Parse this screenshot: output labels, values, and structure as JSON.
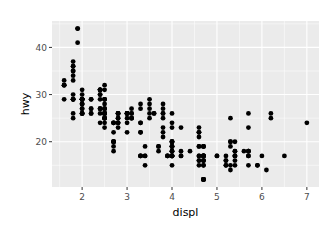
{
  "chart_data": {
    "type": "scatter",
    "title": "",
    "xlabel": "displ",
    "ylabel": "hwy",
    "xlim": [
      1.33,
      7.27
    ],
    "ylim": [
      10.4,
      45.6
    ],
    "xticks": [
      2,
      3,
      4,
      5,
      6,
      7
    ],
    "yticks": [
      20,
      30,
      40
    ],
    "grid": true,
    "legend": null,
    "colors": {
      "panel": "#EBEBEB",
      "grid": "#FFFFFF",
      "point": "#000000",
      "tick_text": "#4D4D4D",
      "tick_mark": "#333333"
    },
    "points": [
      [
        1.8,
        29
      ],
      [
        1.8,
        29
      ],
      [
        2.0,
        31
      ],
      [
        2.0,
        30
      ],
      [
        2.8,
        26
      ],
      [
        2.8,
        26
      ],
      [
        3.1,
        27
      ],
      [
        1.8,
        26
      ],
      [
        1.8,
        25
      ],
      [
        2.0,
        28
      ],
      [
        2.0,
        27
      ],
      [
        2.8,
        25
      ],
      [
        2.8,
        25
      ],
      [
        3.1,
        25
      ],
      [
        3.1,
        25
      ],
      [
        2.8,
        24
      ],
      [
        3.1,
        25
      ],
      [
        4.2,
        23
      ],
      [
        5.3,
        20
      ],
      [
        5.3,
        15
      ],
      [
        5.3,
        20
      ],
      [
        5.7,
        17
      ],
      [
        6.0,
        17
      ],
      [
        5.7,
        26
      ],
      [
        5.7,
        23
      ],
      [
        6.2,
        26
      ],
      [
        6.2,
        25
      ],
      [
        7.0,
        24
      ],
      [
        5.3,
        19
      ],
      [
        5.3,
        14
      ],
      [
        5.7,
        15
      ],
      [
        6.5,
        17
      ],
      [
        2.4,
        27
      ],
      [
        2.4,
        30
      ],
      [
        3.1,
        26
      ],
      [
        3.5,
        29
      ],
      [
        3.6,
        26
      ],
      [
        2.4,
        24
      ],
      [
        3.0,
        24
      ],
      [
        3.3,
        22
      ],
      [
        3.3,
        22
      ],
      [
        3.3,
        24
      ],
      [
        3.3,
        24
      ],
      [
        3.3,
        17
      ],
      [
        3.8,
        22
      ],
      [
        3.8,
        21
      ],
      [
        3.8,
        23
      ],
      [
        4.0,
        23
      ],
      [
        3.7,
        19
      ],
      [
        3.7,
        18
      ],
      [
        3.9,
        17
      ],
      [
        3.9,
        17
      ],
      [
        4.7,
        19
      ],
      [
        4.7,
        19
      ],
      [
        4.7,
        12
      ],
      [
        5.2,
        17
      ],
      [
        5.2,
        15
      ],
      [
        3.9,
        17
      ],
      [
        4.7,
        17
      ],
      [
        4.7,
        12
      ],
      [
        4.7,
        17
      ],
      [
        5.2,
        16
      ],
      [
        5.7,
        18
      ],
      [
        5.9,
        15
      ],
      [
        4.7,
        16
      ],
      [
        4.7,
        12
      ],
      [
        4.7,
        17
      ],
      [
        4.7,
        17
      ],
      [
        4.7,
        16
      ],
      [
        4.7,
        12
      ],
      [
        5.2,
        15
      ],
      [
        5.2,
        16
      ],
      [
        5.7,
        17
      ],
      [
        5.9,
        15
      ],
      [
        4.6,
        17
      ],
      [
        5.4,
        17
      ],
      [
        5.4,
        18
      ],
      [
        4.0,
        17
      ],
      [
        4.0,
        19
      ],
      [
        4.0,
        17
      ],
      [
        4.0,
        19
      ],
      [
        4.6,
        19
      ],
      [
        5.0,
        17
      ],
      [
        4.2,
        17
      ],
      [
        4.2,
        17
      ],
      [
        4.6,
        16
      ],
      [
        4.6,
        16
      ],
      [
        4.6,
        17
      ],
      [
        5.4,
        15
      ],
      [
        5.4,
        17
      ],
      [
        3.8,
        26
      ],
      [
        3.8,
        25
      ],
      [
        4.0,
        26
      ],
      [
        4.0,
        24
      ],
      [
        4.6,
        21
      ],
      [
        4.6,
        22
      ],
      [
        4.6,
        23
      ],
      [
        4.6,
        22
      ],
      [
        5.4,
        20
      ],
      [
        1.6,
        33
      ],
      [
        1.6,
        32
      ],
      [
        1.6,
        32
      ],
      [
        1.6,
        29
      ],
      [
        1.6,
        32
      ],
      [
        1.8,
        34
      ],
      [
        1.8,
        36
      ],
      [
        1.8,
        36
      ],
      [
        2.0,
        29
      ],
      [
        2.4,
        26
      ],
      [
        2.4,
        27
      ],
      [
        2.4,
        30
      ],
      [
        2.4,
        31
      ],
      [
        2.5,
        26
      ],
      [
        2.5,
        26
      ],
      [
        3.3,
        28
      ],
      [
        2.0,
        26
      ],
      [
        2.0,
        29
      ],
      [
        2.0,
        28
      ],
      [
        2.0,
        27
      ],
      [
        2.7,
        24
      ],
      [
        2.7,
        24
      ],
      [
        2.7,
        24
      ],
      [
        3.0,
        22
      ],
      [
        3.7,
        19
      ],
      [
        4.0,
        20
      ],
      [
        4.7,
        17
      ],
      [
        4.7,
        12
      ],
      [
        4.7,
        19
      ],
      [
        5.7,
        18
      ],
      [
        6.1,
        14
      ],
      [
        4.0,
        15
      ],
      [
        4.2,
        18
      ],
      [
        4.4,
        18
      ],
      [
        4.6,
        15
      ],
      [
        5.4,
        17
      ],
      [
        5.4,
        16
      ],
      [
        5.4,
        18
      ],
      [
        4.0,
        17
      ],
      [
        4.0,
        19
      ],
      [
        4.6,
        19
      ],
      [
        5.0,
        17
      ],
      [
        2.4,
        29
      ],
      [
        2.4,
        27
      ],
      [
        2.5,
        31
      ],
      [
        2.5,
        32
      ],
      [
        3.5,
        27
      ],
      [
        3.5,
        26
      ],
      [
        3.0,
        26
      ],
      [
        3.0,
        25
      ],
      [
        3.5,
        25
      ],
      [
        3.3,
        17
      ],
      [
        3.3,
        17
      ],
      [
        4.0,
        20
      ],
      [
        5.6,
        18
      ],
      [
        3.1,
        26
      ],
      [
        3.8,
        26
      ],
      [
        3.8,
        27
      ],
      [
        3.8,
        28
      ],
      [
        5.3,
        25
      ],
      [
        2.5,
        25
      ],
      [
        2.5,
        24
      ],
      [
        2.5,
        27
      ],
      [
        2.5,
        25
      ],
      [
        2.5,
        26
      ],
      [
        2.5,
        23
      ],
      [
        2.2,
        26
      ],
      [
        2.2,
        26
      ],
      [
        2.5,
        26
      ],
      [
        2.5,
        26
      ],
      [
        2.5,
        25
      ],
      [
        2.5,
        27
      ],
      [
        2.5,
        25
      ],
      [
        2.5,
        27
      ],
      [
        2.7,
        20
      ],
      [
        2.7,
        20
      ],
      [
        4.0,
        19
      ],
      [
        4.0,
        17
      ],
      [
        4.0,
        20
      ],
      [
        4.0,
        17
      ],
      [
        4.0,
        17
      ],
      [
        4.0,
        18
      ],
      [
        4.7,
        15
      ],
      [
        4.7,
        17
      ],
      [
        2.7,
        19
      ],
      [
        2.7,
        18
      ],
      [
        3.4,
        15
      ],
      [
        3.4,
        17
      ],
      [
        4.0,
        18
      ],
      [
        4.7,
        16
      ],
      [
        2.2,
        29
      ],
      [
        2.2,
        27
      ],
      [
        2.4,
        31
      ],
      [
        2.4,
        31
      ],
      [
        3.0,
        26
      ],
      [
        3.0,
        26
      ],
      [
        3.5,
        28
      ],
      [
        2.2,
        27
      ],
      [
        2.2,
        29
      ],
      [
        2.4,
        31
      ],
      [
        2.4,
        31
      ],
      [
        3.0,
        26
      ],
      [
        3.0,
        26
      ],
      [
        3.3,
        27
      ],
      [
        1.8,
        30
      ],
      [
        1.8,
        33
      ],
      [
        1.8,
        35
      ],
      [
        1.8,
        37
      ],
      [
        1.8,
        35
      ],
      [
        4.7,
        15
      ],
      [
        5.7,
        18
      ],
      [
        2.7,
        20
      ],
      [
        2.7,
        20
      ],
      [
        2.7,
        22
      ],
      [
        3.4,
        17
      ],
      [
        3.4,
        19
      ],
      [
        4.0,
        18
      ],
      [
        4.0,
        20
      ],
      [
        2.0,
        29
      ],
      [
        2.0,
        26
      ],
      [
        2.0,
        29
      ],
      [
        2.0,
        29
      ],
      [
        2.8,
        24
      ],
      [
        1.9,
        44
      ],
      [
        2.0,
        29
      ],
      [
        2.0,
        26
      ],
      [
        2.0,
        29
      ],
      [
        2.0,
        29
      ],
      [
        2.5,
        29
      ],
      [
        2.5,
        29
      ],
      [
        2.8,
        23
      ],
      [
        2.8,
        24
      ],
      [
        1.9,
        44
      ],
      [
        1.9,
        41
      ],
      [
        2.0,
        29
      ],
      [
        2.0,
        26
      ],
      [
        2.5,
        28
      ],
      [
        2.5,
        29
      ],
      [
        1.8,
        29
      ],
      [
        1.8,
        29
      ],
      [
        2.0,
        28
      ],
      [
        2.0,
        29
      ],
      [
        2.8,
        26
      ],
      [
        2.8,
        26
      ],
      [
        3.6,
        26
      ]
    ]
  }
}
